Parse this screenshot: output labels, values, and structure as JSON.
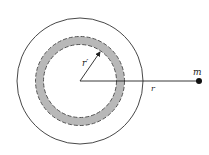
{
  "diagram": {
    "labels": {
      "mass": "m",
      "distance": "r",
      "shell_radius": "r′"
    },
    "colors": {
      "line": "#333333",
      "shell_fill": "#b8b8b8",
      "shell_dash": "#555555",
      "mass": "#111111"
    }
  }
}
